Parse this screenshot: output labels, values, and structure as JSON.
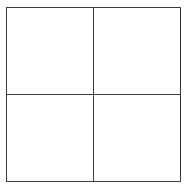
{
  "diagram": {
    "title": "",
    "type": "2x2-grid",
    "rows": 2,
    "columns": 2,
    "background_color": "#ffffff",
    "line_color": "#3c3c3c",
    "line_width_px": 1.5,
    "frame": {
      "x": 6,
      "y": 7,
      "width": 175,
      "height": 175
    },
    "dividers": {
      "vertical_x": 92,
      "horizontal_y": 93
    },
    "cells": [
      {
        "position": "top-left",
        "label": ""
      },
      {
        "position": "top-right",
        "label": ""
      },
      {
        "position": "bottom-left",
        "label": ""
      },
      {
        "position": "bottom-right",
        "label": ""
      }
    ]
  }
}
